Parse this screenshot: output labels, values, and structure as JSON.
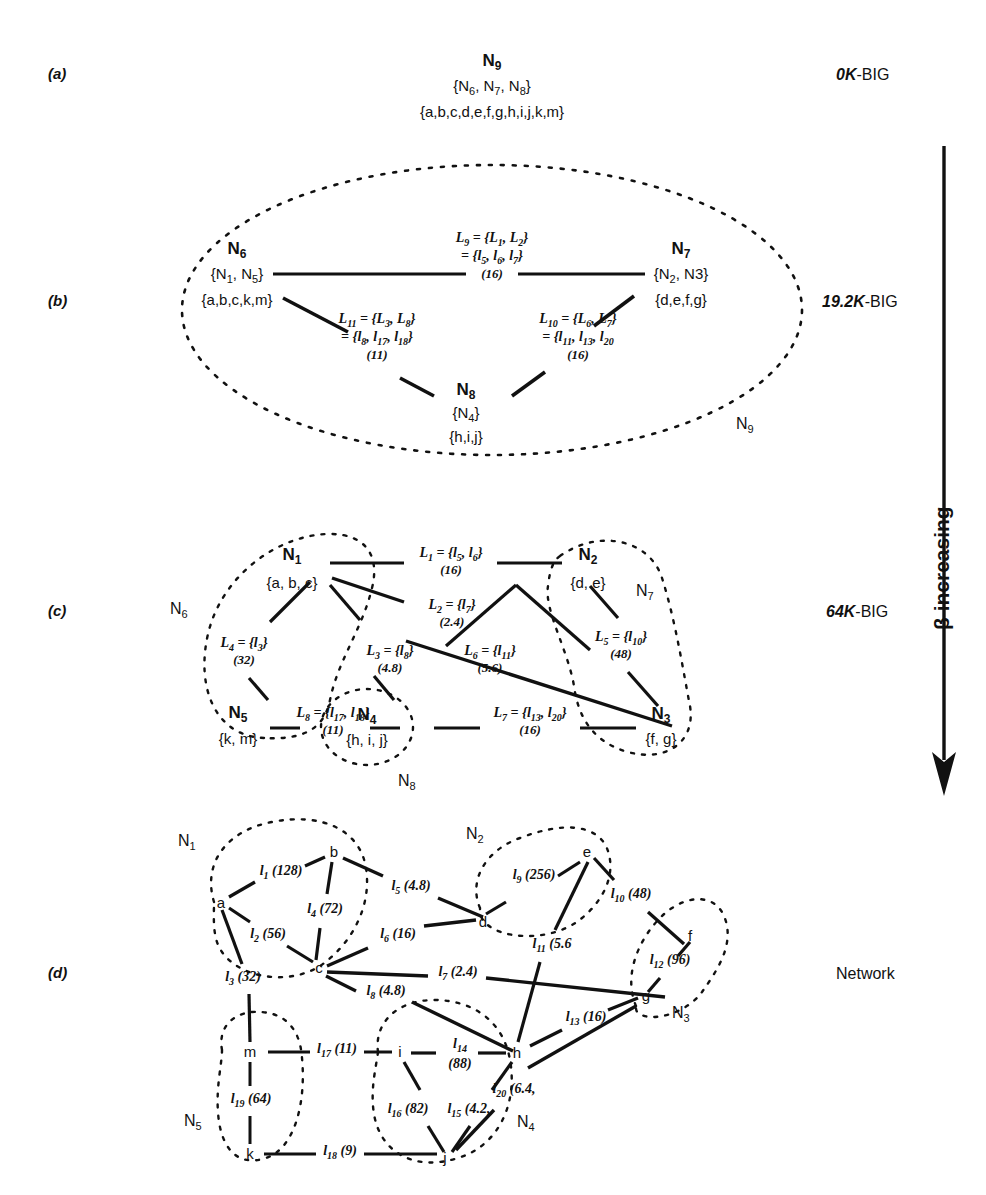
{
  "figure": {
    "panel_letters": [
      "(a)",
      "(b)",
      "(c)",
      "(d)"
    ],
    "stage_labels": [
      "0K-BIG",
      "19.2K-BIG",
      "64K-BIG",
      "Network"
    ],
    "axis_label": "β increasing",
    "axis_direction": "down"
  },
  "panel_a": {
    "cluster_name": "N",
    "cluster_sub": "9",
    "children": "{N6, N7, N8}",
    "children_parts": [
      {
        "t": "{N",
        "sub": "6"
      },
      {
        "t": ", N",
        "sub": "7"
      },
      {
        "t": ", N",
        "sub": "8"
      },
      {
        "t": "}",
        "sub": ""
      }
    ],
    "members": "{a,b,c,d,e,f,g,h,i,j,k,m}"
  },
  "panel_b": {
    "outer_tag": "N",
    "outer_tag_sub": "9",
    "nodes": [
      {
        "name": "N",
        "sub": "6",
        "children": "{N1, N5}",
        "members": "{a,b,c,k,m}"
      },
      {
        "name": "N",
        "sub": "7",
        "children": "{N2, N3}",
        "members": "{d,e,f,g}"
      },
      {
        "name": "N",
        "sub": "8",
        "children": "{N4}",
        "members": "{h,i,j}"
      }
    ],
    "links": [
      {
        "id": "L9",
        "name": "L",
        "sub": "9",
        "def": "= {L1, L2}",
        "expand": "= {l5, l6, l7}",
        "weight": "(16)"
      },
      {
        "id": "L11",
        "name": "L",
        "sub": "11",
        "def": "= {L3, L8}",
        "expand": "= {l8, l17, l18}",
        "weight": "(11)"
      },
      {
        "id": "L10",
        "name": "L",
        "sub": "10",
        "def": "= {L6, L7}",
        "expand": "= {l11, l13, l20}",
        "weight": "(16)"
      }
    ]
  },
  "panel_c": {
    "outer_tags": [
      {
        "name": "N",
        "sub": "6"
      },
      {
        "name": "N",
        "sub": "7"
      },
      {
        "name": "N",
        "sub": "8"
      }
    ],
    "nodes": [
      {
        "name": "N",
        "sub": "1",
        "members": "{a, b, c}"
      },
      {
        "name": "N",
        "sub": "2",
        "members": "{d, e}"
      },
      {
        "name": "N",
        "sub": "3",
        "members": "{f, g}"
      },
      {
        "name": "N",
        "sub": "4",
        "members": "{h, i, j}"
      },
      {
        "name": "N",
        "sub": "5",
        "members": "{k, m}"
      }
    ],
    "links": [
      {
        "name": "L",
        "sub": "1",
        "def": "= {l5, l6}",
        "weight": "(16)"
      },
      {
        "name": "L",
        "sub": "2",
        "def": "= {l7}",
        "weight": "(2.4)"
      },
      {
        "name": "L",
        "sub": "3",
        "def": "= {l8}",
        "weight": "(4.8)"
      },
      {
        "name": "L",
        "sub": "4",
        "def": "= {l3}",
        "weight": "(32)"
      },
      {
        "name": "L",
        "sub": "5",
        "def": "= {l10}",
        "weight": "(48)"
      },
      {
        "name": "L",
        "sub": "6",
        "def": "= {l11}",
        "weight": "(5.6)"
      },
      {
        "name": "L",
        "sub": "7",
        "def": "= {l13, l20}",
        "weight": "(16)"
      },
      {
        "name": "L",
        "sub": "8",
        "def": "= {l17, l18}",
        "weight": "(11)"
      }
    ]
  },
  "panel_d": {
    "cluster_tags": [
      {
        "name": "N",
        "sub": "1"
      },
      {
        "name": "N",
        "sub": "2"
      },
      {
        "name": "N",
        "sub": "3"
      },
      {
        "name": "N",
        "sub": "4"
      },
      {
        "name": "N",
        "sub": "5"
      }
    ],
    "vertices": [
      "a",
      "b",
      "c",
      "d",
      "e",
      "f",
      "g",
      "h",
      "i",
      "j",
      "k",
      "m"
    ],
    "edges": [
      {
        "name": "l",
        "sub": "1",
        "weight": "(128)",
        "from": "a",
        "to": "b"
      },
      {
        "name": "l",
        "sub": "2",
        "weight": "(56)",
        "from": "a",
        "to": "c"
      },
      {
        "name": "l",
        "sub": "3",
        "weight": "(32)",
        "from": "a",
        "to": "m"
      },
      {
        "name": "l",
        "sub": "4",
        "weight": "(72)",
        "from": "b",
        "to": "c"
      },
      {
        "name": "l",
        "sub": "5",
        "weight": "(4.8)",
        "from": "b",
        "to": "d"
      },
      {
        "name": "l",
        "sub": "6",
        "weight": "(16)",
        "from": "c",
        "to": "d"
      },
      {
        "name": "l",
        "sub": "7",
        "weight": "(2.4)",
        "from": "c",
        "to": "g"
      },
      {
        "name": "l",
        "sub": "8",
        "weight": "(4.8)",
        "from": "c",
        "to": "h"
      },
      {
        "name": "l",
        "sub": "9",
        "weight": "(256)",
        "from": "d",
        "to": "e"
      },
      {
        "name": "l",
        "sub": "10",
        "weight": "(48)",
        "from": "e",
        "to": "f"
      },
      {
        "name": "l",
        "sub": "11",
        "weight": "(5.6)",
        "from": "e",
        "to": "h"
      },
      {
        "name": "l",
        "sub": "12",
        "weight": "(96)",
        "from": "f",
        "to": "g"
      },
      {
        "name": "l",
        "sub": "13",
        "weight": "(16)",
        "from": "g",
        "to": "h"
      },
      {
        "name": "l",
        "sub": "14",
        "weight": "(88)",
        "from": "i",
        "to": "h"
      },
      {
        "name": "l",
        "sub": "15",
        "weight": "(4.2)",
        "from": "h",
        "to": "j"
      },
      {
        "name": "l",
        "sub": "16",
        "weight": "(82)",
        "from": "i",
        "to": "j"
      },
      {
        "name": "l",
        "sub": "17",
        "weight": "(11)",
        "from": "m",
        "to": "i"
      },
      {
        "name": "l",
        "sub": "18",
        "weight": "(9)",
        "from": "k",
        "to": "j"
      },
      {
        "name": "l",
        "sub": "19",
        "weight": "(64)",
        "from": "m",
        "to": "k"
      },
      {
        "name": "l",
        "sub": "20",
        "weight": "(6.4)",
        "from": "j",
        "to": "g"
      }
    ]
  },
  "colors": {
    "ink": "#111111",
    "background": "#ffffff"
  }
}
